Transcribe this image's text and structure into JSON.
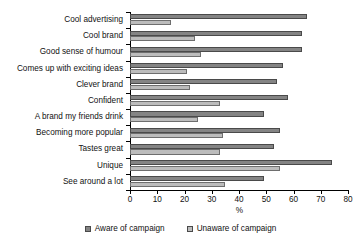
{
  "chart_data": {
    "type": "bar",
    "orientation": "horizontal",
    "title": "",
    "xlabel": "%",
    "ylabel": "",
    "xlim": [
      0,
      80
    ],
    "xticks": [
      0,
      10,
      20,
      30,
      40,
      50,
      60,
      70,
      80
    ],
    "grid": false,
    "legend_position": "bottom",
    "categories": [
      "Cool advertising",
      "Cool brand",
      "Good sense of humour",
      "Comes up with exciting ideas",
      "Clever brand",
      "Confident",
      "A brand my friends drink",
      "Becoming more popular",
      "Tastes great",
      "Unique",
      "See around a lot"
    ],
    "series": [
      {
        "name": "Aware of campaign",
        "color": "#848484",
        "values": [
          65,
          63,
          63,
          56,
          54,
          58,
          49,
          55,
          53,
          74,
          49
        ]
      },
      {
        "name": "Unaware of campaign",
        "color": "#bcbcbc",
        "values": [
          15,
          24,
          26,
          21,
          22,
          33,
          25,
          34,
          33,
          55,
          35
        ]
      }
    ]
  },
  "legend": {
    "items": [
      {
        "label": "Aware of campaign",
        "swatch": "legend-swatch-dark"
      },
      {
        "label": "Unaware of campaign",
        "swatch": "legend-swatch-light"
      }
    ]
  }
}
